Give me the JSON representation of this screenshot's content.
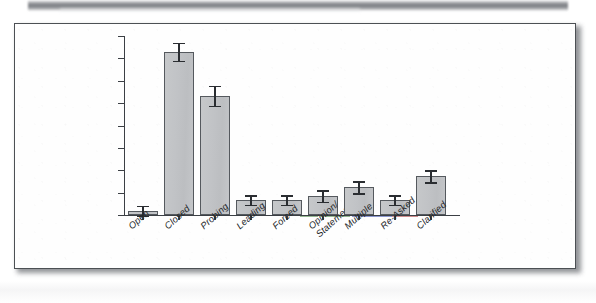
{
  "figure": {
    "background_color": "#fefefe",
    "frame_color": "#4c5054",
    "bar_fill_color": "#c2c4c7",
    "bar_edge_color": "#55595e",
    "error_bar_color": "#2a2d31"
  },
  "chart_data": {
    "type": "bar",
    "title": "",
    "subtitle": "",
    "xlabel": "",
    "ylabel": "",
    "grid": false,
    "legend": "none",
    "axis": {
      "y_tick_labels": [],
      "y_tick_count": 9,
      "y_axis_labeled": false,
      "ylim": [
        0,
        180
      ]
    },
    "categories": [
      "Open",
      "Closed",
      "Probing",
      "Leading",
      "Forced",
      "Opinion/ Statement",
      "Multiple",
      "Re-Asked",
      "Clarified"
    ],
    "category_lines": [
      [
        "Open"
      ],
      [
        "Closed"
      ],
      [
        "Probing"
      ],
      [
        "Leading"
      ],
      [
        "Forced"
      ],
      [
        "Opinion/",
        "Statement"
      ],
      [
        "Multiple"
      ],
      [
        "Re-Asked"
      ],
      [
        "Clarified"
      ]
    ],
    "values": [
      4,
      164,
      120,
      15,
      15,
      19,
      28,
      15,
      39
    ],
    "errors": [
      5,
      9,
      10,
      5,
      5,
      6,
      6,
      5,
      6
    ],
    "series": [
      {
        "name": "Mean frequency",
        "values": [
          4,
          164,
          120,
          15,
          15,
          19,
          28,
          15,
          39
        ]
      }
    ]
  }
}
